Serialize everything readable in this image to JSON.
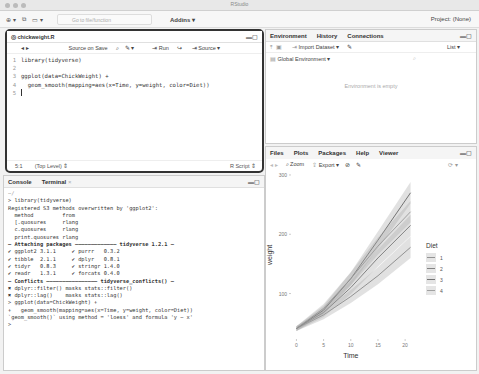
{
  "window": {
    "title": "RStudio"
  },
  "toolbar": {
    "goto_placeholder": "Go to file/function",
    "addins_label": "Addins",
    "project_label": "Project: (None)"
  },
  "editor": {
    "tab_label": "chickweight.R",
    "source_on_save": "Source on Save",
    "run_label": "Run",
    "source_label": "Source",
    "lines": [
      {
        "n": "1",
        "text": "library(tidyverse)"
      },
      {
        "n": "2",
        "text": ""
      },
      {
        "n": "3",
        "text": "ggplot(data=ChickWeight) +"
      },
      {
        "n": "4",
        "text": "  geom_smooth(mapping=aes(x=Time, y=weight, color=Diet))"
      },
      {
        "n": "5",
        "text": ""
      }
    ],
    "status_position": "5:1",
    "status_scope": "(Top Level)",
    "status_type": "R Script"
  },
  "console": {
    "tabs": [
      "Console",
      "Terminal"
    ],
    "path": "~/",
    "lines": [
      "> library(tidyverse)",
      "Registered S3 methods overwritten by 'ggplot2':",
      "  method         from",
      "  [.quosures     rlang",
      "  c.quosures     rlang",
      "  print.quosures rlang",
      "— Attaching packages ————————————— tidyverse 1.2.1 —",
      "✔ ggplot2 3.1.1     ✔ purrr   0.3.2",
      "✔ tibble  2.1.1     ✔ dplyr   0.8.1",
      "✔ tidyr   0.8.3     ✔ stringr 1.4.0",
      "✔ readr   1.3.1     ✔ forcats 0.4.0",
      "— Conflicts ———————————————— tidyverse_conflicts() —",
      "✖ dplyr::filter() masks stats::filter()",
      "✖ dplyr::lag()    masks stats::lag()",
      "> ggplot(data=ChickWeight) +",
      "+   geom_smooth(mapping=aes(x=Time, y=weight, color=Diet))",
      "`geom_smooth()` using method = 'loess' and formula 'y ~ x'",
      ">"
    ]
  },
  "environment": {
    "tabs": [
      "Environment",
      "History",
      "Connections"
    ],
    "import_label": "Import Dataset",
    "list_label": "List",
    "scope_label": "Global Environment",
    "empty_message": "Environment is empty"
  },
  "plots_pane": {
    "tabs": [
      "Files",
      "Plots",
      "Packages",
      "Help",
      "Viewer"
    ],
    "zoom_label": "Zoom",
    "export_label": "Export"
  },
  "chart_data": {
    "type": "line",
    "title": "",
    "xlabel": "Time",
    "ylabel": "weight",
    "x_ticks": [
      0,
      5,
      10,
      15,
      20
    ],
    "y_ticks": [
      100,
      200,
      300
    ],
    "xlim": [
      -1,
      22
    ],
    "ylim": [
      25,
      305
    ],
    "legend_title": "Diet",
    "legend_position": "right",
    "grid": false,
    "x": [
      0,
      5,
      10,
      15,
      21
    ],
    "series": [
      {
        "name": "1",
        "values": [
          41,
          64,
          95,
          130,
          178
        ]
      },
      {
        "name": "2",
        "values": [
          41,
          68,
          110,
          160,
          215
        ]
      },
      {
        "name": "3",
        "values": [
          41,
          72,
          125,
          190,
          270
        ]
      },
      {
        "name": "4",
        "values": [
          41,
          75,
          125,
          180,
          238
        ]
      }
    ]
  }
}
